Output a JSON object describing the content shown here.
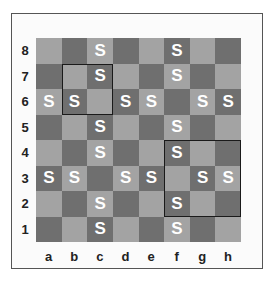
{
  "board": {
    "files": [
      "a",
      "b",
      "c",
      "d",
      "e",
      "f",
      "g",
      "h"
    ],
    "ranks": [
      "8",
      "7",
      "6",
      "5",
      "4",
      "3",
      "2",
      "1"
    ],
    "piece_label": "S",
    "colors": {
      "light": "#a3a3a3",
      "dark": "#6f6f6f",
      "piece": "#ffffff",
      "highlight": "#1a1a1a"
    },
    "pieces": [
      "c8",
      "f8",
      "c7",
      "f7",
      "a6",
      "b6",
      "d6",
      "e6",
      "g6",
      "h6",
      "c5",
      "f5",
      "c4",
      "f4",
      "a3",
      "b3",
      "d3",
      "e3",
      "g3",
      "h3",
      "c2",
      "f2",
      "c1",
      "f1"
    ],
    "highlights": [
      {
        "name": "highlight-b7-c6",
        "from": "b7",
        "to": "c6"
      },
      {
        "name": "highlight-f4-h2",
        "from": "f4",
        "to": "h2"
      }
    ]
  }
}
